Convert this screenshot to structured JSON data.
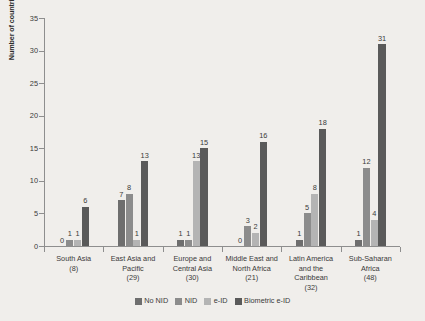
{
  "chart_data": {
    "type": "bar",
    "title": "",
    "subtitle": "",
    "xlabel": "",
    "ylabel": "Number of countries",
    "ylim": [
      0,
      35
    ],
    "yticks": [
      0,
      5,
      10,
      15,
      20,
      25,
      30,
      35
    ],
    "grid": false,
    "legend_position": "bottom",
    "categories": [
      "South Asia\n(8)",
      "East Asia and\nPacific\n(29)",
      "Europe and\nCentral Asia\n(30)",
      "Middle East and\nNorth Africa\n(21)",
      "Latin America\nand the\nCaribbean\n(32)",
      "Sub-Saharan\nAfrica\n(48)"
    ],
    "category_names": [
      "South Asia",
      "East Asia and Pacific",
      "Europe and Central Asia",
      "Middle East and North Africa",
      "Latin America and the Caribbean",
      "Sub-Saharan Africa"
    ],
    "category_counts": [
      "(8)",
      "(29)",
      "(30)",
      "(21)",
      "(32)",
      "(48)"
    ],
    "series": [
      {
        "name": "No NID",
        "color": "#6e6e6e",
        "values": [
          0,
          7,
          1,
          0,
          1,
          1
        ],
        "labels": [
          "0",
          "7",
          "1",
          "0",
          "1",
          "1"
        ]
      },
      {
        "name": "NID",
        "color": "#8c8c8c",
        "values": [
          1,
          8,
          1,
          3,
          5,
          12
        ],
        "labels": [
          "1",
          "8",
          "1",
          "3",
          "5",
          "12"
        ]
      },
      {
        "name": "e-ID",
        "color": "#b4b4b4",
        "values": [
          1,
          1,
          13,
          2,
          8,
          4
        ],
        "labels": [
          "1",
          "1",
          "13",
          "2",
          "8",
          "4"
        ]
      },
      {
        "name": "Biometric e-ID",
        "color": "#5a5a5a",
        "values": [
          6,
          13,
          15,
          16,
          18,
          31
        ],
        "labels": [
          "6",
          "13",
          "15",
          "16",
          "18",
          "31"
        ]
      }
    ]
  },
  "colors": {
    "background": "#f0eeeb",
    "axis": "#8e8e8e",
    "text": "#3a3a3a"
  }
}
